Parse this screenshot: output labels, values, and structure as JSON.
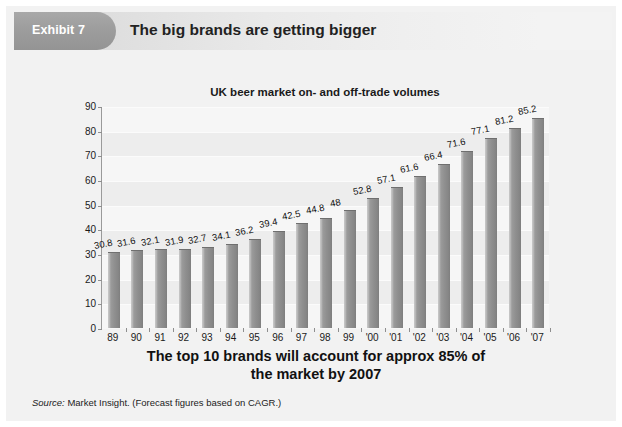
{
  "header": {
    "exhibit_label": "Exhibit 7",
    "title": "The big brands are getting bigger"
  },
  "caption": {
    "line1": "The top 10 brands will account for approx 85% of",
    "line2": "the market by 2007"
  },
  "source": {
    "label": "Source:",
    "text": " Market Insight. (Forecast figures based on CAGR.)"
  },
  "colors": {
    "page_background": "#f2f2f2",
    "plot_background": "#ededed",
    "bar_fill": "#8f8f8f",
    "bar_highlight": "#c9c9c9",
    "tab_fill": "#9d9d9d",
    "axis": "#9a9a9a",
    "text": "#1a1a1a"
  },
  "chart_data": {
    "type": "bar",
    "title": "UK beer market on- and off-trade volumes",
    "xlabel": "",
    "ylabel": "",
    "ylim": [
      0,
      90
    ],
    "yticks": [
      0,
      10,
      20,
      30,
      40,
      50,
      60,
      70,
      80,
      90
    ],
    "ytick_labels": [
      "0",
      "10",
      "20",
      "30",
      "40",
      "50",
      "60",
      "70",
      "80",
      "90"
    ],
    "grid": true,
    "legend": false,
    "categories": [
      "89",
      "90",
      "91",
      "92",
      "93",
      "94",
      "95",
      "96",
      "97",
      "98",
      "99",
      "'00",
      "'01",
      "'02",
      "'03",
      "'04",
      "'05",
      "'06",
      "'07"
    ],
    "values": [
      30.8,
      31.6,
      32.1,
      31.9,
      32.7,
      34.1,
      36.2,
      39.4,
      42.5,
      44.8,
      48,
      52.8,
      57.1,
      61.6,
      66.4,
      71.6,
      77.1,
      81.2,
      85.2
    ],
    "data_labels": [
      "30.8",
      "31.6",
      "32.1",
      "31.9",
      "32.7",
      "34.1",
      "36.2",
      "39.4",
      "42.5",
      "44.8",
      "48",
      "52.8",
      "57.1",
      "61.6",
      "66.4",
      "71.6",
      "77.1",
      "81.2",
      "85.2"
    ],
    "data_label_rotation": -11,
    "annotation": "The top 10 brands will account for approx 85% of the market by 2007"
  }
}
